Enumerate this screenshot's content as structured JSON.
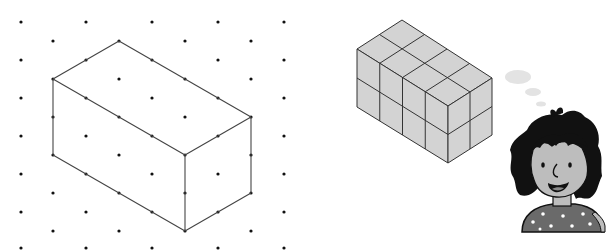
{
  "figure": {
    "colors": {
      "background": "#ffffff",
      "dot": "#111111",
      "line": "#444444",
      "cube_face": "#d3d3d3",
      "cube_edge": "#333333",
      "hair": "#111111",
      "skin": "#bdbdbd",
      "shirt": "#6a6a6a",
      "star": "#ffffff",
      "bubble": "#e3e3e3"
    }
  },
  "dot_grid": {
    "columns_x": [
      21,
      53,
      86,
      119,
      152,
      185,
      218,
      251,
      284
    ],
    "even_rows_y": [
      22,
      60,
      98,
      136,
      174,
      212,
      248
    ],
    "odd_rows_y": [
      41,
      79,
      117,
      155,
      193,
      231
    ],
    "dot_radius": 1.6
  },
  "drawn_cuboid": {
    "dimensions": {
      "length": 4,
      "width": 2,
      "height": 2
    },
    "vertices": {
      "top_back": [
        119,
        41
      ],
      "top_left": [
        53,
        79
      ],
      "top_right": [
        251,
        117
      ],
      "top_front": [
        185,
        155
      ],
      "bottom_left": [
        53,
        155
      ],
      "bottom_front": [
        185,
        231
      ],
      "bottom_right": [
        251,
        193
      ]
    }
  },
  "cube_stack": {
    "dimensions": {
      "length": 4,
      "width": 2,
      "height": 2
    },
    "cube_count": 16,
    "vertices": {
      "top_back": [
        402,
        20
      ],
      "top_left": [
        357,
        49
      ],
      "top_right": [
        492,
        78
      ],
      "top_front": [
        448,
        106
      ],
      "bottom_left": [
        357,
        107
      ],
      "bottom_front": [
        448,
        163
      ],
      "bottom_right": [
        492,
        135
      ]
    }
  },
  "thought_bubble": {
    "puffs": [
      {
        "cx": 518,
        "cy": 77,
        "rx": 13,
        "ry": 7
      },
      {
        "cx": 533,
        "cy": 92,
        "rx": 8,
        "ry": 4
      },
      {
        "cx": 541,
        "cy": 104,
        "rx": 5,
        "ry": 2.5
      }
    ]
  },
  "character": {
    "name": "girl",
    "expression": "smiling",
    "shirt_pattern": "stars"
  }
}
